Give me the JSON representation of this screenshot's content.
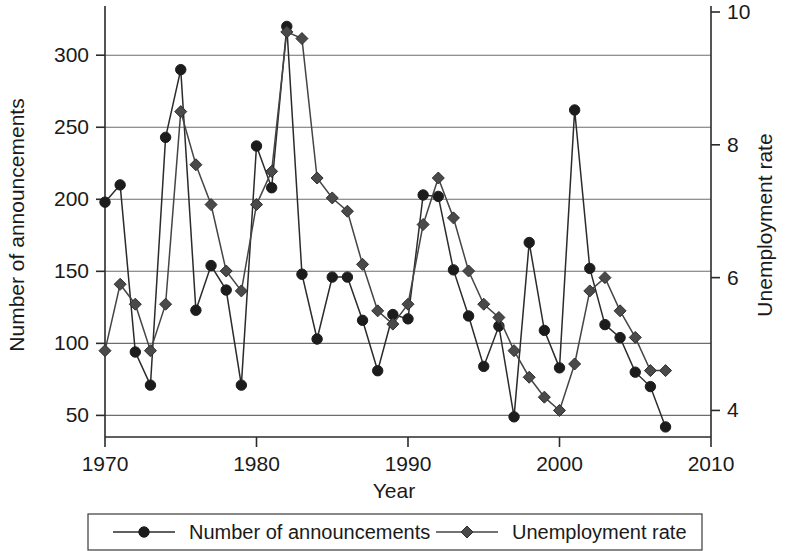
{
  "chart_data": {
    "type": "line",
    "title": "",
    "xlabel": "Year",
    "ylabel": "Number of announcements",
    "y2label": "Unemployment rate",
    "xlim": [
      1970,
      2010
    ],
    "ylim": [
      35,
      330
    ],
    "y2lim": [
      3.6,
      10.0
    ],
    "xticks": [
      1970,
      1980,
      1990,
      2000,
      2010
    ],
    "xtick_labels": [
      "1970",
      "1980",
      "1990",
      "2000",
      "2010"
    ],
    "yticks": [
      50,
      100,
      150,
      200,
      250,
      300
    ],
    "ytick_labels": [
      "50",
      "100",
      "150",
      "200",
      "250",
      "300"
    ],
    "y2ticks": [
      4,
      6,
      8,
      10
    ],
    "y2tick_labels": [
      "4",
      "6",
      "8",
      "10"
    ],
    "grid": true,
    "grid_axis": "y",
    "legend_position": "bottom",
    "x": [
      1970,
      1971,
      1972,
      1973,
      1974,
      1975,
      1976,
      1977,
      1978,
      1979,
      1980,
      1981,
      1982,
      1983,
      1984,
      1985,
      1986,
      1987,
      1988,
      1989,
      1990,
      1991,
      1992,
      1993,
      1994,
      1995,
      1996,
      1997,
      1998,
      1999,
      2000,
      2001,
      2002,
      2003,
      2004,
      2005,
      2006,
      2007
    ],
    "series": [
      {
        "name": "Number of announcements",
        "marker": "circle",
        "axis": "left",
        "color": "#1c1c1c",
        "values": [
          198,
          210,
          94,
          71,
          243,
          290,
          123,
          154,
          137,
          71,
          237,
          208,
          320,
          148,
          103,
          146,
          146,
          116,
          81,
          120,
          117,
          203,
          202,
          151,
          119,
          84,
          112,
          49,
          170,
          109,
          83,
          262,
          152,
          113,
          104,
          80,
          70,
          42
        ]
      },
      {
        "name": "Unemployment rate",
        "marker": "diamond",
        "axis": "right",
        "color": "#4a4a4a",
        "values": [
          4.9,
          5.9,
          5.6,
          4.9,
          5.6,
          8.5,
          7.7,
          7.1,
          6.1,
          5.8,
          7.1,
          7.6,
          9.7,
          9.6,
          7.5,
          7.2,
          7.0,
          6.2,
          5.5,
          5.3,
          5.6,
          6.8,
          7.5,
          6.9,
          6.1,
          5.6,
          5.4,
          4.9,
          4.5,
          4.2,
          4.0,
          4.7,
          5.8,
          6.0,
          5.5,
          5.1,
          4.6,
          4.6
        ]
      }
    ]
  },
  "legend": {
    "items": [
      {
        "label": "Number of announcements",
        "marker": "circle"
      },
      {
        "label": "Unemployment rate",
        "marker": "diamond"
      }
    ]
  }
}
